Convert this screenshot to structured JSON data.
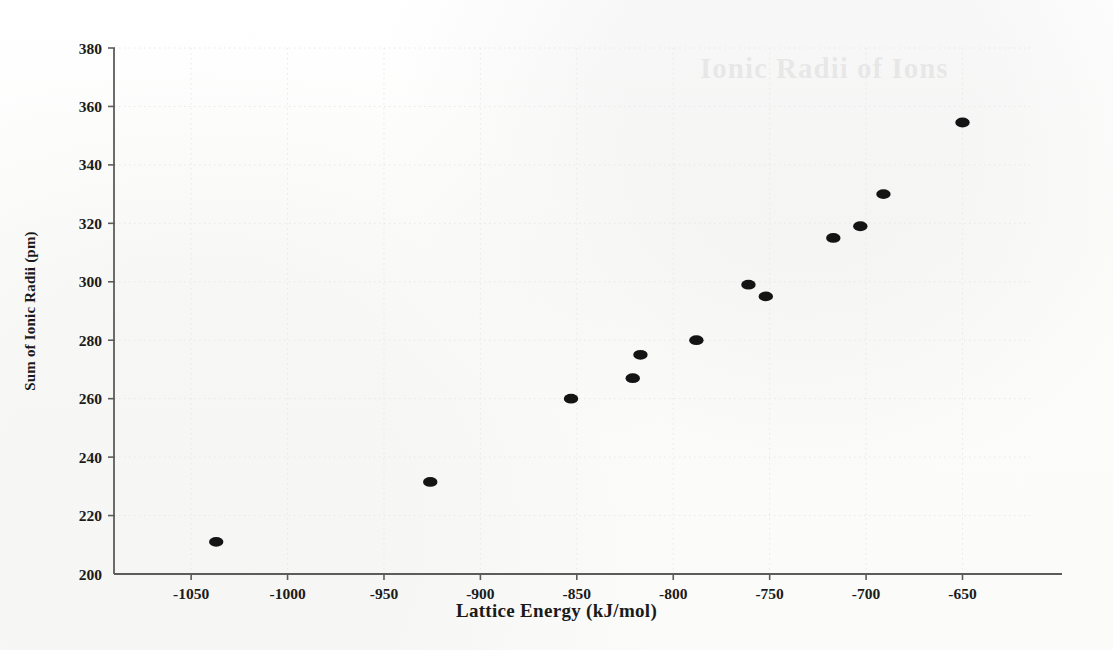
{
  "figure": {
    "ghost_text": "Ionic Radii of Ions",
    "background_color": "#fdfdfc",
    "marker_color": "#141414",
    "axis_color": "#5c5c5c",
    "grid_color": "#e8e8e6"
  },
  "chart_data": {
    "type": "scatter",
    "title": "",
    "xlabel": "Lattice Energy (kJ/mol)",
    "ylabel": "Sum of Ionic Radii (pm)",
    "xlim": [
      -1090,
      -615
    ],
    "ylim": [
      200,
      380
    ],
    "xticks": [
      -1050,
      -1000,
      -950,
      -900,
      -850,
      -800,
      -750,
      -700,
      -650
    ],
    "yticks": [
      200,
      220,
      240,
      260,
      280,
      300,
      320,
      340,
      360,
      380
    ],
    "xtick_labels": [
      "-1050",
      "-1000",
      "-950",
      "-900",
      "-850",
      "-800",
      "-750",
      "-700",
      "-650"
    ],
    "ytick_labels": [
      "200",
      "220",
      "240",
      "260",
      "280",
      "300",
      "320",
      "340",
      "360",
      "380"
    ],
    "grid": true,
    "legend": false,
    "marker": "filled-ellipse",
    "x": [
      -1037,
      -926,
      -853,
      -821,
      -817,
      -788,
      -761,
      -752,
      -717,
      -703,
      -691,
      -650
    ],
    "y": [
      211,
      231.5,
      260,
      267,
      275,
      280,
      299,
      295,
      315,
      319,
      330,
      354.5
    ],
    "points": [
      {
        "x": -1037,
        "y": 211
      },
      {
        "x": -926,
        "y": 231.5
      },
      {
        "x": -853,
        "y": 260
      },
      {
        "x": -821,
        "y": 267
      },
      {
        "x": -817,
        "y": 275
      },
      {
        "x": -788,
        "y": 280
      },
      {
        "x": -761,
        "y": 299
      },
      {
        "x": -752,
        "y": 295
      },
      {
        "x": -717,
        "y": 315
      },
      {
        "x": -703,
        "y": 319
      },
      {
        "x": -691,
        "y": 330
      },
      {
        "x": -650,
        "y": 354.5
      }
    ]
  }
}
